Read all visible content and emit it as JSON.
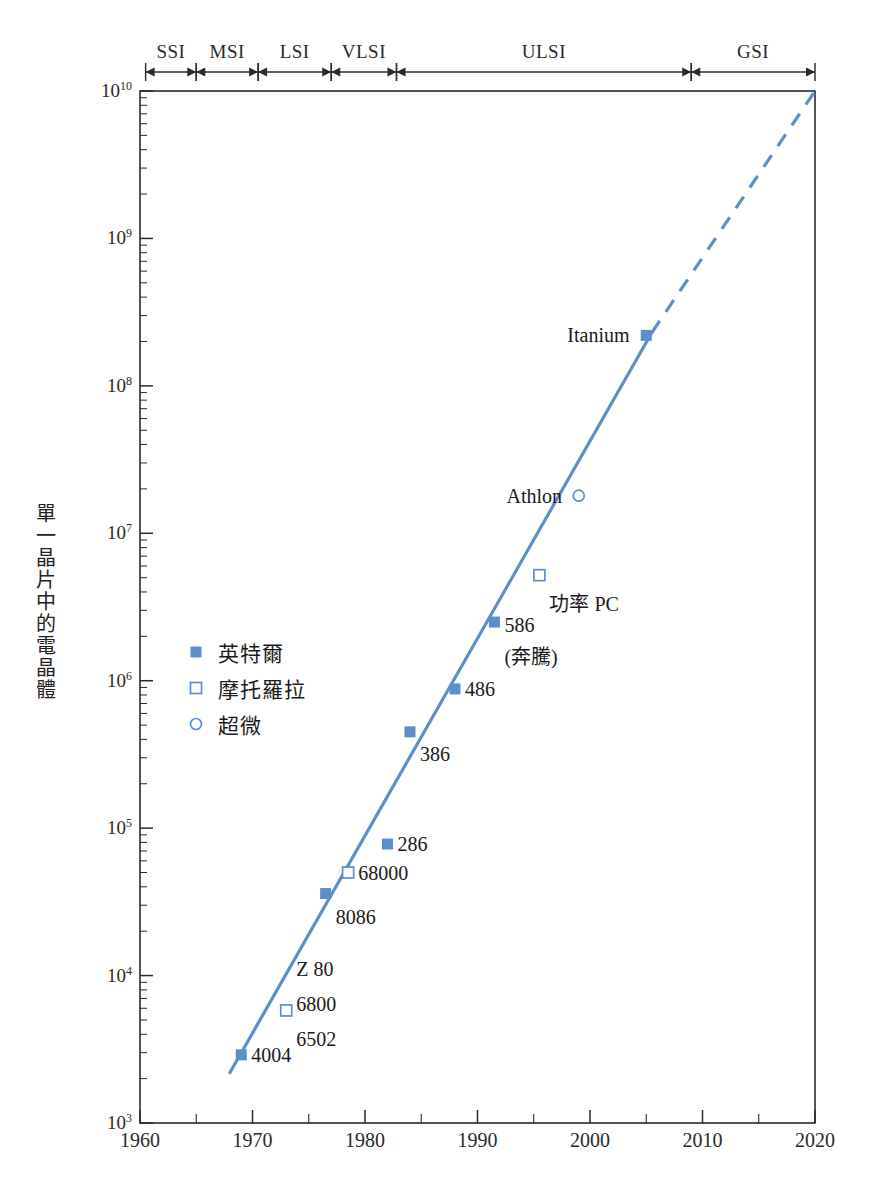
{
  "chart_data": {
    "type": "scatter",
    "title": "",
    "xlabel": "",
    "ylabel": "單一晶片中的電晶體",
    "xlim": [
      1960,
      2020
    ],
    "ylim": [
      1000,
      10000000000
    ],
    "yscale": "log",
    "xscale": "linear",
    "grid": false,
    "legend_position": "inner-left",
    "xticks": [
      "1960",
      "1970",
      "1980",
      "1990",
      "2000",
      "2010",
      "2020"
    ],
    "xtick_values": [
      1960,
      1970,
      1980,
      1990,
      2000,
      2010,
      2020
    ],
    "yticks": [
      "10^3",
      "10^4",
      "10^5",
      "10^6",
      "10^7",
      "10^8",
      "10^9",
      "10^10"
    ],
    "ytick_values": [
      1000,
      10000,
      100000,
      1000000,
      10000000,
      100000000,
      1000000000,
      10000000000
    ],
    "ytick_mantissa": "10",
    "ytick_exponents": [
      "3",
      "4",
      "5",
      "6",
      "7",
      "8",
      "9",
      "10"
    ],
    "series": [
      {
        "name": "英特爾",
        "marker": "filled-square",
        "color": "#5b8fc9",
        "points": [
          {
            "label": "4004",
            "x": 1969,
            "y": 2900
          },
          {
            "label": "8086",
            "x": 1976.5,
            "y": 36000
          },
          {
            "label": "286",
            "x": 1982,
            "y": 78000
          },
          {
            "label": "386",
            "x": 1984,
            "y": 450000
          },
          {
            "label": "486",
            "x": 1988,
            "y": 880000
          },
          {
            "label": "586",
            "x": 1991.5,
            "y": 2500000
          },
          {
            "label": "Itanium",
            "x": 2005,
            "y": 220000000
          }
        ]
      },
      {
        "name": "摩托羅拉",
        "marker": "open-square",
        "color": "#5b8fc9",
        "points": [
          {
            "label": "Z 80",
            "x": 1973,
            "y": 5800
          },
          {
            "label": "68000",
            "x": 1978.5,
            "y": 50000
          },
          {
            "label": "功率 PC",
            "x": 1995.5,
            "y": 5200000
          }
        ]
      },
      {
        "name": "超微",
        "marker": "open-circle",
        "color": "#5b8fc9",
        "points": [
          {
            "label": "Athlon",
            "x": 1999,
            "y": 18000000
          }
        ]
      }
    ],
    "trend_line": {
      "color": "#5b8fc9",
      "solid_segment": {
        "x0": 1968,
        "y0": 2200,
        "x1": 2005.5,
        "y1": 230000000
      },
      "dashed_segment": {
        "x0": 2005.5,
        "y0": 230000000,
        "x1": 2020,
        "y1": 10000000000
      }
    },
    "annotations": [
      {
        "text": "4004",
        "x": 1969,
        "y": 2900,
        "anchor": "left"
      },
      {
        "text": "Z 80",
        "x": 1973,
        "y": 11000,
        "anchor": "left"
      },
      {
        "text": "6800",
        "x": 1973,
        "y": 6400,
        "anchor": "left"
      },
      {
        "text": "6502",
        "x": 1973,
        "y": 3700,
        "anchor": "left"
      },
      {
        "text": "8086",
        "x": 1976.5,
        "y": 25000,
        "anchor": "left"
      },
      {
        "text": "68000",
        "x": 1978.5,
        "y": 50000,
        "anchor": "left"
      },
      {
        "text": "286",
        "x": 1982,
        "y": 78000,
        "anchor": "left"
      },
      {
        "text": "386",
        "x": 1984,
        "y": 320000,
        "anchor": "left"
      },
      {
        "text": "486",
        "x": 1988,
        "y": 880000,
        "anchor": "left"
      },
      {
        "text": "586",
        "x": 1991.5,
        "y": 2400000,
        "anchor": "left"
      },
      {
        "text": "(奔騰)",
        "x": 1991.5,
        "y": 1500000,
        "anchor": "left"
      },
      {
        "text": "功率 PC",
        "x": 1995.5,
        "y": 3400000,
        "anchor": "left"
      },
      {
        "text": "Athlon",
        "x": 1998.4,
        "y": 18000000,
        "anchor": "right"
      },
      {
        "text": "Itanium",
        "x": 2004.4,
        "y": 220000000,
        "anchor": "right"
      }
    ],
    "eras": [
      {
        "label": "SSI",
        "start": 1960.5,
        "end": 1965.0
      },
      {
        "label": "MSI",
        "start": 1965.0,
        "end": 1970.5
      },
      {
        "label": "LSI",
        "start": 1970.5,
        "end": 1977.0
      },
      {
        "label": "VLSI",
        "start": 1977.0,
        "end": 1982.8
      },
      {
        "label": "ULSI",
        "start": 1982.8,
        "end": 2009.0
      },
      {
        "label": "GSI",
        "start": 2009.0,
        "end": 2020.0
      }
    ]
  },
  "legend": {
    "items": [
      {
        "label": "英特爾",
        "marker": "filled-square"
      },
      {
        "label": "摩托羅拉",
        "marker": "open-square"
      },
      {
        "label": "超微",
        "marker": "open-circle"
      }
    ]
  },
  "colors": {
    "data_blue": "#5b8fc9",
    "axis_black": "#2a2a2a",
    "text": "#1a1a1a",
    "background": "#ffffff"
  },
  "caption": ""
}
